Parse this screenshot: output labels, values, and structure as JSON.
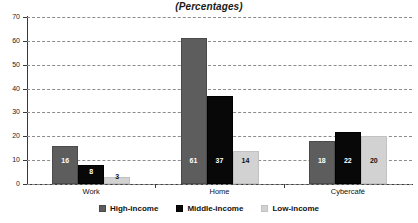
{
  "chart_data": {
    "type": "bar",
    "title": "(Percentages)",
    "xlabel": "",
    "ylabel": "",
    "categories": [
      "Work",
      "Home",
      "Cybercafé"
    ],
    "series": [
      {
        "name": "High-income",
        "color": "#5d5d5d",
        "values": [
          16,
          61,
          18
        ]
      },
      {
        "name": "Middle-income",
        "color": "#080808",
        "values": [
          8,
          37,
          22
        ]
      },
      {
        "name": "Low-income",
        "color": "#d2d2d2",
        "values": [
          3,
          14,
          20
        ]
      }
    ],
    "ylim": [
      0,
      70
    ],
    "yticks": [
      "0",
      "10",
      "20",
      "30",
      "40",
      "50",
      "60",
      "70"
    ],
    "grid": true,
    "legend_position": "bottom"
  },
  "legend": {
    "items": [
      {
        "label": "High-income"
      },
      {
        "label": "Middle-income"
      },
      {
        "label": "Low-income"
      }
    ]
  }
}
